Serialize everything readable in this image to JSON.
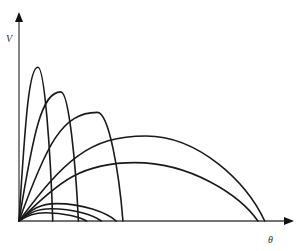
{
  "diagram": {
    "y_axis_label": "V",
    "x_axis_label": "θ",
    "stroke_color": "#1a1a1a",
    "curves": [
      {
        "name": "curve-1",
        "start": 0.0,
        "peak_x": 0.07,
        "peak_y": 0.75,
        "end": 0.125
      },
      {
        "name": "curve-2",
        "start": 0.0,
        "peak_x": 0.155,
        "peak_y": 0.63,
        "end": 0.22
      },
      {
        "name": "curve-3",
        "start": 0.0,
        "peak_x": 0.29,
        "peak_y": 0.53,
        "end": 0.385
      },
      {
        "name": "curve-4",
        "start": 0.0,
        "peak_x": 0.47,
        "peak_y": 0.415,
        "end": 0.91
      },
      {
        "name": "curve-5",
        "start": 0.0,
        "peak_x": 0.43,
        "peak_y": 0.285,
        "end": 0.885
      },
      {
        "name": "curve-6",
        "start": 0.0,
        "peak_x": 0.14,
        "peak_y": 0.085,
        "end": 0.36
      },
      {
        "name": "curve-7",
        "start": 0.0,
        "peak_x": 0.12,
        "peak_y": 0.06,
        "end": 0.305
      },
      {
        "name": "curve-8",
        "start": 0.0,
        "peak_x": 0.1,
        "peak_y": 0.04,
        "end": 0.25
      }
    ]
  }
}
